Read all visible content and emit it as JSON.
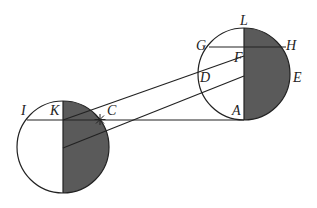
{
  "diagram": {
    "colors": {
      "stroke": "#222222",
      "shade": "#5a5a5a",
      "background": "#ffffff"
    },
    "labels": {
      "L": "L",
      "G": "G",
      "H": "H",
      "F": "F",
      "D": "D",
      "E": "E",
      "A": "A",
      "I": "I",
      "K": "K",
      "C": "C"
    }
  }
}
